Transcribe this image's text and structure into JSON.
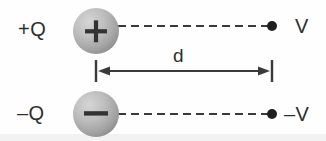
{
  "figure": {
    "background_color": "#fefefe",
    "width": 326,
    "height": 141
  },
  "labels": {
    "positive_charge": "+Q",
    "negative_charge": "–Q",
    "positive_potential": "V",
    "negative_potential": "–V",
    "separation": "d"
  },
  "spheres": [
    {
      "name": "positive-charge-sphere",
      "sign_glyph": "+",
      "cx": 96,
      "cy": 31,
      "r": 23,
      "fill_light": "#c9c9c9",
      "fill_dark": "#8f8f8f"
    },
    {
      "name": "negative-charge-sphere",
      "sign_glyph": "–",
      "cx": 96,
      "cy": 114,
      "r": 23,
      "fill_light": "#c9c9c9",
      "fill_dark": "#8f8f8f"
    }
  ],
  "dashed_lines": [
    {
      "name": "positive-lead-line",
      "x1": 118,
      "y1": 26,
      "x2": 268,
      "y2": 26
    },
    {
      "name": "negative-lead-line",
      "x1": 118,
      "y1": 114,
      "x2": 268,
      "y2": 114
    }
  ],
  "terminal_dots": [
    {
      "name": "positive-terminal-dot",
      "cx": 272,
      "cy": 26,
      "r": 5
    },
    {
      "name": "negative-terminal-dot",
      "cx": 272,
      "cy": 114,
      "r": 5
    }
  ],
  "dimension_line": {
    "name": "separation-dimension",
    "x_start": 96,
    "x_end": 272,
    "y": 71,
    "tick_half_height": 11,
    "label": "d",
    "label_x": 182,
    "label_y": 55
  },
  "colors": {
    "ink": "#2e2e2e",
    "line": "#3a3a3a",
    "sphere_light": "#cccccc",
    "sphere_mid": "#a8a8a8",
    "sphere_dark": "#8a8a8a",
    "background": "#fefefe",
    "bottom_band": "#f2f2f2"
  }
}
